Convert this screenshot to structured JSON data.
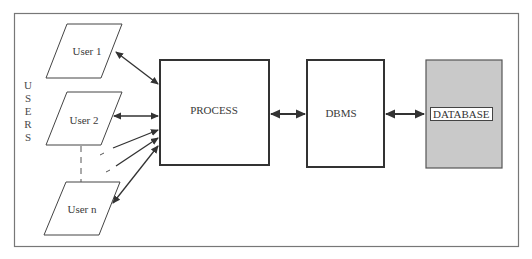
{
  "diagram": {
    "title": "",
    "side_label": "USERS",
    "users": [
      {
        "label": "User 1"
      },
      {
        "label": "User 2"
      },
      {
        "label": "User n"
      }
    ],
    "process": {
      "label": "PROCESS"
    },
    "dbms": {
      "label": "DBMS"
    },
    "database": {
      "label": "DATABASE",
      "fill": "#c9c9c9"
    },
    "connections": [
      {
        "from": "User 1",
        "to": "PROCESS",
        "type": "bidirectional"
      },
      {
        "from": "User 2",
        "to": "PROCESS",
        "type": "bidirectional"
      },
      {
        "from": "(dashed, more users)",
        "to": "PROCESS",
        "type": "unidirectional"
      },
      {
        "from": "(dashed, more users)",
        "to": "PROCESS",
        "type": "unidirectional"
      },
      {
        "from": "User n",
        "to": "PROCESS",
        "type": "bidirectional"
      },
      {
        "from": "PROCESS",
        "to": "DBMS",
        "type": "bidirectional"
      },
      {
        "from": "DBMS",
        "to": "DATABASE",
        "type": "bidirectional"
      }
    ],
    "colors": {
      "stroke": "#333333",
      "frame": "#777777",
      "database_fill": "#c9c9c9"
    }
  }
}
